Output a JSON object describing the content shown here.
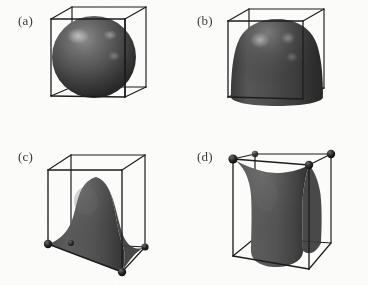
{
  "figure": {
    "type": "scientific-illustration",
    "background_color": "#fdfdfc",
    "wireframe_color": "#1d1d1d",
    "surface_color": "#4a4a4a",
    "surface_shadow_color": "#222222",
    "highlight_color": "#b8b8b8",
    "marker_color": "#141414",
    "panel_count": 4
  },
  "panels": [
    {
      "id": "a",
      "label": "(a)",
      "shape_name": "sphere",
      "shape_description": "Shaded sphere centered inside the wireframe cube, touching the top face",
      "corner_markers": 0,
      "marker_positions": "none"
    },
    {
      "id": "b",
      "label": "(b)",
      "shape_name": "dome",
      "shape_description": "Bullet or dome shaped surface, rounded at the top and flared down to the cube base",
      "corner_markers": 0,
      "marker_positions": "none"
    },
    {
      "id": "c",
      "label": "(c)",
      "shape_name": "bell-tent",
      "shape_description": "Bell or tent shaped surface with concave flanks flaring outward to meet the four bottom cube corners",
      "corner_markers": 4,
      "marker_positions": "bottom"
    },
    {
      "id": "d",
      "label": "(d)",
      "shape_name": "cushion",
      "shape_description": "Cushion or hourglass shaped surface with concave sides flaring upward to meet the four top cube corners",
      "corner_markers": 4,
      "marker_positions": "top"
    }
  ]
}
